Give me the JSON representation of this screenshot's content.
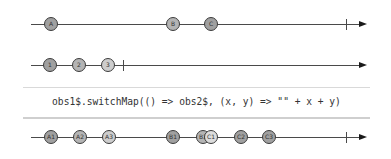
{
  "colors": {
    "line": "#4a4a4a",
    "arrow": "#1a1a1a",
    "marble_border": "#3c3c3c",
    "marble_dark": "#a0a0a0",
    "marble_light": "#cdcdcd",
    "operator_text": "#333333"
  },
  "timelines": {
    "source": {
      "label": "obs1$",
      "marbles": [
        {
          "label": "A",
          "x": 51
        },
        {
          "label": "B",
          "x": 173
        },
        {
          "label": "C",
          "x": 211
        }
      ],
      "complete_x": 346
    },
    "inner": {
      "label": "obs2$",
      "marbles": [
        {
          "label": "1",
          "x": 50
        },
        {
          "label": "2",
          "x": 79
        },
        {
          "label": "3",
          "x": 108
        }
      ],
      "complete_x": 123
    },
    "output": {
      "marbles": [
        {
          "label": "A1",
          "x": 51
        },
        {
          "label": "A2",
          "x": 80
        },
        {
          "label": "A3",
          "x": 109
        },
        {
          "label": "B1",
          "x": 173
        },
        {
          "label": "B2",
          "x": 203
        },
        {
          "label": "C1",
          "x": 211
        },
        {
          "label": "C2",
          "x": 241
        },
        {
          "label": "C3",
          "x": 269
        }
      ],
      "complete_x": 346
    }
  },
  "operator": {
    "expression": "obs1$.switchMap(() => obs2$, (x, y) => \"\" + x + y)"
  }
}
